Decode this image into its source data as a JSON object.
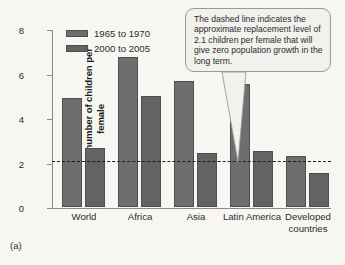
{
  "caption": "(a)",
  "callout": {
    "text": "The dashed line indicates the approximate replacement level of 2.1 children per female that will give zero population growth in the long term."
  },
  "chart_data": {
    "type": "bar",
    "title": "",
    "xlabel": "",
    "ylabel": "Average number of children per female",
    "ylim": [
      0,
      8
    ],
    "yticks": [
      0,
      2,
      4,
      6,
      8
    ],
    "ytick_labels": [
      "0",
      "2",
      "4",
      "6",
      "8"
    ],
    "grid": false,
    "legend_position": "top-left",
    "categories": [
      "World",
      "Africa",
      "Asia",
      "Latin America",
      "Developed countries"
    ],
    "series": [
      {
        "name": "1965 to 1970",
        "color": "#6e6e6e",
        "values": [
          4.9,
          6.75,
          5.65,
          5.55,
          2.3
        ]
      },
      {
        "name": "2000 to 2005",
        "color": "#636363",
        "values": [
          2.65,
          5.0,
          2.45,
          2.5,
          1.55
        ]
      }
    ],
    "annotations": [
      {
        "type": "hline",
        "label": "replacement level",
        "value": 2.1,
        "style": "dashed",
        "color": "#1c1c1c"
      }
    ]
  }
}
